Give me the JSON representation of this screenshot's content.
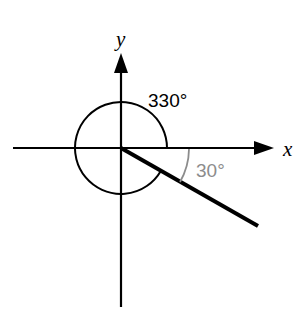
{
  "diagram": {
    "type": "angle-in-standard-position",
    "axes": {
      "x_label": "x",
      "y_label": "y"
    },
    "angles": {
      "main_angle_label": "330°",
      "reference_angle_label": "30°",
      "main_angle_degrees": 330,
      "reference_angle_degrees": 30
    },
    "colors": {
      "stroke": "#000000",
      "reference": "#8c8c8c",
      "background": "#ffffff"
    }
  }
}
